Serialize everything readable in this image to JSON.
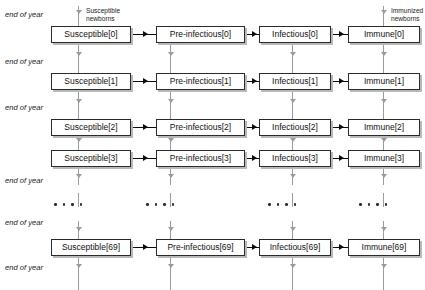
{
  "diagram": {
    "type": "flowchart",
    "colors": {
      "box_border": "#2b2b2b",
      "box_fill": "#ffffff",
      "box_shadow": "#b9b9b9",
      "aging_arrow": "#9a9a9a",
      "transition_arrow": "#0b0b0b",
      "text": "#111111"
    },
    "columns": [
      {
        "name": "susceptible",
        "label_prefix": "Susceptible"
      },
      {
        "name": "pre-infectious",
        "label_prefix": "Pre-infectious"
      },
      {
        "name": "infectious",
        "label_prefix": "Infectious"
      },
      {
        "name": "immune",
        "label_prefix": "Immune"
      }
    ],
    "age_indices": [
      "0",
      "1",
      "2",
      "3",
      "69"
    ],
    "boxes": [
      {
        "row": 0,
        "col": 0,
        "label": "Susceptible[0]"
      },
      {
        "row": 0,
        "col": 1,
        "label": "Pre-infectious[0]"
      },
      {
        "row": 0,
        "col": 2,
        "label": "Infectious[0]"
      },
      {
        "row": 0,
        "col": 3,
        "label": "Immune[0]"
      },
      {
        "row": 1,
        "col": 0,
        "label": "Susceptible[1]"
      },
      {
        "row": 1,
        "col": 1,
        "label": "Pre-infectious[1]"
      },
      {
        "row": 1,
        "col": 2,
        "label": "Infectious[1]"
      },
      {
        "row": 1,
        "col": 3,
        "label": "Immune[1]"
      },
      {
        "row": 2,
        "col": 0,
        "label": "Susceptible[2]"
      },
      {
        "row": 2,
        "col": 1,
        "label": "Pre-infectious[2]"
      },
      {
        "row": 2,
        "col": 2,
        "label": "Infectious[2]"
      },
      {
        "row": 2,
        "col": 3,
        "label": "Immune[2]"
      },
      {
        "row": 3,
        "col": 0,
        "label": "Susceptible[3]"
      },
      {
        "row": 3,
        "col": 1,
        "label": "Pre-infectious[3]"
      },
      {
        "row": 3,
        "col": 2,
        "label": "Infectious[3]"
      },
      {
        "row": 3,
        "col": 3,
        "label": "Immune[3]"
      },
      {
        "row": 4,
        "col": 0,
        "label": "Susceptible[69]"
      },
      {
        "row": 4,
        "col": 1,
        "label": "Pre-infectious[69]"
      },
      {
        "row": 4,
        "col": 2,
        "label": "Infectious[69]"
      },
      {
        "row": 4,
        "col": 3,
        "label": "Immune[69]"
      }
    ],
    "end_of_year_labels": [
      "end of year",
      "end of year",
      "end of year",
      "end of year",
      "end of year",
      "end of year"
    ],
    "inflow_labels": [
      {
        "column": "susceptible",
        "line1": "Susceptible",
        "line2": "newborns"
      },
      {
        "column": "immune",
        "line1": "Immunized",
        "line2": "newborns"
      }
    ],
    "ellipsis_dot_count": 4
  }
}
